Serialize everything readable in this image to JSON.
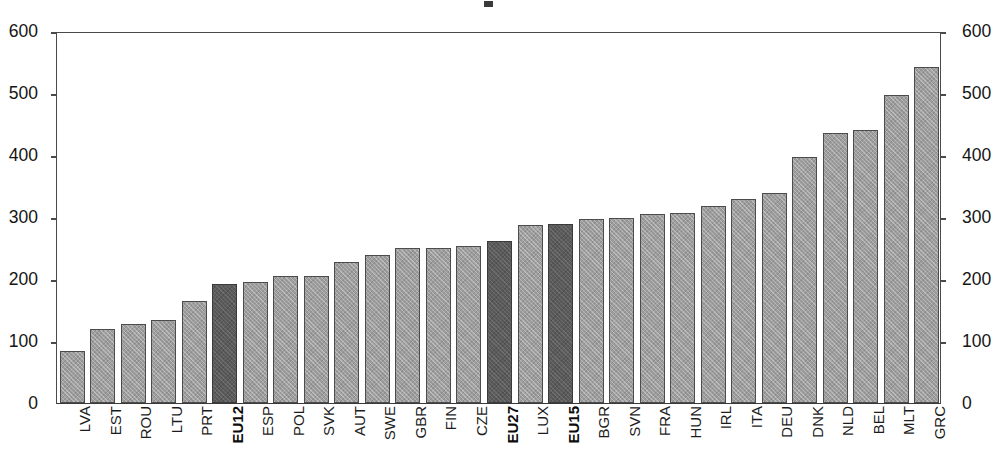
{
  "chart_data": {
    "type": "bar",
    "title": "",
    "subtitle": "",
    "xlabel": "",
    "ylabel": "",
    "ylim": [
      0,
      600
    ],
    "grid": false,
    "legend": null,
    "dual_axis": true,
    "axis_left": {
      "ticks": [
        0,
        100,
        200,
        300,
        400,
        500,
        600
      ],
      "tick_labels": [
        "0",
        "100",
        "200",
        "300",
        "400",
        "500",
        "600"
      ]
    },
    "axis_right": {
      "ticks": [
        0,
        100,
        200,
        300,
        400,
        500,
        600
      ],
      "tick_labels": [
        "0",
        "100",
        "200",
        "300",
        "400",
        "500",
        "600"
      ]
    },
    "categories": [
      "LVA",
      "EST",
      "ROU",
      "LTU",
      "PRT",
      "EU12",
      "ESP",
      "POL",
      "SVK",
      "AUT",
      "SWE",
      "GBR",
      "FIN",
      "CZE",
      "EU27",
      "LUX",
      "EU15",
      "BGR",
      "SVN",
      "FRA",
      "HUN",
      "IRL",
      "ITA",
      "DEU",
      "DNK",
      "NLD",
      "BEL",
      "MLT",
      "GRC"
    ],
    "values": [
      84,
      120,
      127,
      134,
      165,
      192,
      195,
      205,
      205,
      227,
      239,
      250,
      250,
      254,
      262,
      287,
      288,
      296,
      298,
      305,
      307,
      317,
      329,
      338,
      397,
      435,
      440,
      496,
      542
    ],
    "highlighted": [
      "EU12",
      "EU27",
      "EU15"
    ],
    "colors": {
      "bar_default": "#9d9d9d",
      "bar_highlight": "#5b5b5b",
      "bar_border": "#4c4c4c",
      "axis": "#4a4a4a",
      "text": "#1a1a1a",
      "background": "#ffffff"
    }
  }
}
